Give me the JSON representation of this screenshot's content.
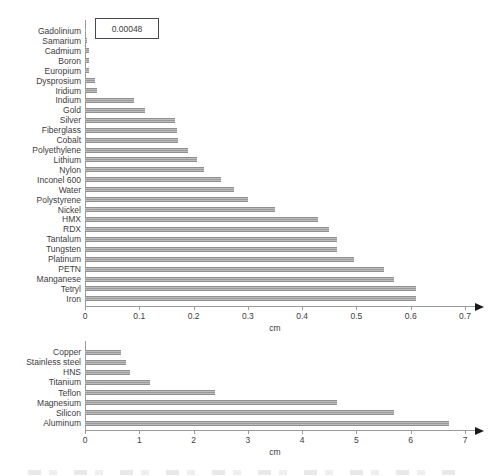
{
  "colors": {
    "bar_fill": "#9a9a9a",
    "bar_fill_light": "#c2c2c2",
    "axis_line": "#9a9a9a",
    "label_text": "#3c3c3c",
    "annotation_border": "#4a4a4a"
  },
  "chart_data": [
    {
      "type": "bar",
      "orientation": "horizontal",
      "xlabel": "cm",
      "xlim": [
        0,
        0.7
      ],
      "xticks": [
        "0",
        "0.1",
        "0.2",
        "0.3",
        "0.4",
        "0.5",
        "0.6",
        "0.7"
      ],
      "grid": false,
      "categories": [
        "Gadolinium",
        "Samarium",
        "Cadmium",
        "Boron",
        "Europium",
        "Dysprosium",
        "Iridium",
        "Indium",
        "Gold",
        "Silver",
        "Fiberglass",
        "Cobalt",
        "Polyethylene",
        "Lithium",
        "Nylon",
        "Inconel 600",
        "Water",
        "Polystyrene",
        "Nickel",
        "HMX",
        "RDX",
        "Tantalum",
        "Tungsten",
        "Platinum",
        "PETN",
        "Manganese",
        "Tetryl",
        "Iron"
      ],
      "values": [
        0.00048,
        0.003,
        0.007,
        0.008,
        0.008,
        0.018,
        0.022,
        0.09,
        0.11,
        0.165,
        0.17,
        0.172,
        0.19,
        0.207,
        0.22,
        0.25,
        0.275,
        0.3,
        0.35,
        0.43,
        0.45,
        0.465,
        0.465,
        0.495,
        0.55,
        0.57,
        0.61,
        0.61
      ],
      "annotation": {
        "text": "0.00048",
        "category": "Gadolinium"
      }
    },
    {
      "type": "bar",
      "orientation": "horizontal",
      "xlabel": "cm",
      "xlim": [
        0,
        7
      ],
      "xticks": [
        "0",
        "1",
        "2",
        "3",
        "4",
        "5",
        "6",
        "7"
      ],
      "grid": false,
      "categories": [
        "Copper",
        "Stainless steel",
        "HNS",
        "Titanium",
        "Teflon",
        "Magnesium",
        "Silicon",
        "Aluminum"
      ],
      "values": [
        0.67,
        0.75,
        0.82,
        1.2,
        2.4,
        4.65,
        5.7,
        6.7
      ]
    }
  ]
}
